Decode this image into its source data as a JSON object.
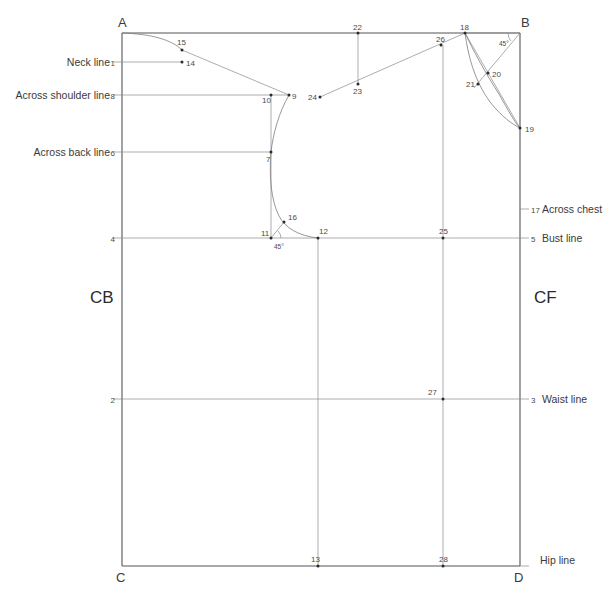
{
  "diagram": {
    "colors": {
      "frame": "#555555",
      "construction": "#8a8a8a",
      "curve": "#7d7d7d",
      "point": "#2b2b2b",
      "text": "#3a3a3a",
      "background": "#ffffff"
    },
    "corners": [
      {
        "id": "A",
        "label": "A",
        "x": 122,
        "y": 33,
        "text_x": 118,
        "text_y": 27
      },
      {
        "id": "B",
        "label": "B",
        "x": 520,
        "y": 33,
        "text_x": 521,
        "text_y": 27
      },
      {
        "id": "C",
        "label": "C",
        "x": 122,
        "y": 566,
        "text_x": 118,
        "text_y": 581
      },
      {
        "id": "D",
        "label": "D",
        "x": 520,
        "y": 566,
        "text_x": 516,
        "text_y": 581
      }
    ],
    "center_labels": [
      {
        "id": "cb",
        "label": "CB",
        "x": 98,
        "y": 302
      },
      {
        "id": "cf",
        "label": "CF",
        "x": 540,
        "y": 302
      }
    ],
    "left_lines": [
      {
        "name": "Neck line",
        "number": "1",
        "y": 62,
        "label_x": 106,
        "num_x": 117
      },
      {
        "name": "Across shoulder line",
        "number": "8",
        "y": 95,
        "label_x": 106,
        "num_x": 117
      },
      {
        "name": "Across back line",
        "number": "6",
        "y": 152,
        "label_x": 106,
        "num_x": 117
      },
      {
        "name": "",
        "number": "4",
        "y": 238,
        "label_x": 106,
        "num_x": 117
      },
      {
        "name": "",
        "number": "2",
        "y": 399,
        "label_x": 106,
        "num_x": 117
      }
    ],
    "right_lines": [
      {
        "name": "Across chest",
        "number": "17",
        "y": 209,
        "num_x": 527,
        "label_x": 540
      },
      {
        "name": "Bust line",
        "number": "5",
        "y": 238,
        "num_x": 527,
        "label_x": 540
      },
      {
        "name": "Waist line",
        "number": "3",
        "y": 399,
        "num_x": 527,
        "label_x": 540
      },
      {
        "name": "Hip line",
        "number": "",
        "y": 560,
        "num_x": 527,
        "label_x": 540
      }
    ],
    "points": [
      {
        "id": "14",
        "label": "14",
        "x": 182,
        "y": 62,
        "tx": 186,
        "ty": 66
      },
      {
        "id": "15",
        "label": "15",
        "x": 182,
        "y": 50,
        "tx": 177,
        "ty": 45
      },
      {
        "id": "9",
        "label": "9",
        "x": 289,
        "y": 95,
        "tx": 292,
        "ty": 99
      },
      {
        "id": "10",
        "label": "10",
        "x": 271,
        "y": 95,
        "tx": 264,
        "ty": 102
      },
      {
        "id": "7",
        "label": "7",
        "x": 271,
        "y": 152,
        "tx": 267,
        "ty": 161
      },
      {
        "id": "16",
        "label": "16",
        "x": 284,
        "y": 222,
        "tx": 288,
        "ty": 220
      },
      {
        "id": "11",
        "label": "11",
        "x": 271,
        "y": 238,
        "tx": 263,
        "ty": 236
      },
      {
        "id": "12",
        "label": "12",
        "x": 318,
        "y": 238,
        "tx": 319,
        "ty": 234
      },
      {
        "id": "13",
        "label": "13",
        "x": 318,
        "y": 566,
        "tx": 314,
        "ty": 562
      },
      {
        "id": "22",
        "label": "22",
        "x": 358,
        "y": 33,
        "tx": 354,
        "ty": 30
      },
      {
        "id": "23",
        "label": "23",
        "x": 358,
        "y": 84,
        "tx": 354,
        "ty": 93
      },
      {
        "id": "24",
        "label": "24",
        "x": 320,
        "y": 97,
        "tx": 310,
        "ty": 100
      },
      {
        "id": "26",
        "label": "26",
        "x": 441,
        "y": 45,
        "tx": 436,
        "ty": 42
      },
      {
        "id": "18",
        "label": "18",
        "x": 465,
        "y": 33,
        "tx": 460,
        "ty": 30
      },
      {
        "id": "20",
        "label": "20",
        "x": 488,
        "y": 73,
        "tx": 492,
        "ty": 77
      },
      {
        "id": "21",
        "label": "21",
        "x": 478,
        "y": 84,
        "tx": 467,
        "ty": 87
      },
      {
        "id": "19",
        "label": "19",
        "x": 520,
        "y": 128,
        "tx": 525,
        "ty": 132
      },
      {
        "id": "25",
        "label": "25",
        "x": 443,
        "y": 238,
        "tx": 439,
        "ty": 234
      },
      {
        "id": "27",
        "label": "27",
        "x": 443,
        "y": 399,
        "tx": 429,
        "ty": 395
      },
      {
        "id": "28",
        "label": "28",
        "x": 443,
        "y": 566,
        "tx": 439,
        "ty": 562
      }
    ],
    "angles": [
      {
        "id": "angle-11",
        "label": "45°",
        "x": 277,
        "y": 248
      },
      {
        "id": "angle-b",
        "label": "45°",
        "x": 500,
        "y": 45
      }
    ]
  }
}
